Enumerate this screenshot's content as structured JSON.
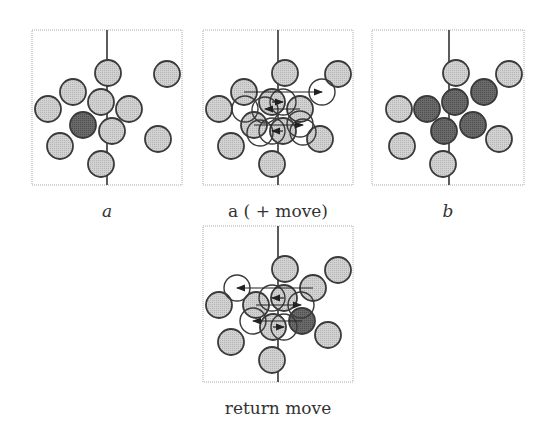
{
  "colors": {
    "light_fill": "#c8c8c8",
    "dark_fill": "#606060",
    "stroke": "#3a3a3a",
    "frame": "#aaaaaa",
    "divider": "#333333",
    "arrow": "#222222"
  },
  "panels": [
    {
      "id": "a",
      "caption": "a",
      "caption_italic": true,
      "frame": {
        "x": 32,
        "y": 30,
        "w": 150,
        "h": 155
      },
      "divider_x": 107,
      "circles": [
        {
          "cx": 108,
          "cy": 73,
          "fill": "light"
        },
        {
          "cx": 167,
          "cy": 74,
          "fill": "light"
        },
        {
          "cx": 73,
          "cy": 92,
          "fill": "light"
        },
        {
          "cx": 48,
          "cy": 109,
          "fill": "light"
        },
        {
          "cx": 101,
          "cy": 102,
          "fill": "light"
        },
        {
          "cx": 129,
          "cy": 109,
          "fill": "light"
        },
        {
          "cx": 83,
          "cy": 125,
          "fill": "dark"
        },
        {
          "cx": 112,
          "cy": 131,
          "fill": "light"
        },
        {
          "cx": 60,
          "cy": 146,
          "fill": "light"
        },
        {
          "cx": 158,
          "cy": 139,
          "fill": "light"
        },
        {
          "cx": 101,
          "cy": 164,
          "fill": "light"
        }
      ],
      "ghosts": [],
      "arrows": []
    },
    {
      "id": "a_move",
      "caption": "a ( + move)",
      "caption_italic": false,
      "frame": {
        "x": 203,
        "y": 30,
        "w": 150,
        "h": 155
      },
      "divider_x": 278,
      "circles": [
        {
          "cx": 285,
          "cy": 73,
          "fill": "light"
        },
        {
          "cx": 338,
          "cy": 74,
          "fill": "light"
        },
        {
          "cx": 244,
          "cy": 92,
          "fill": "light"
        },
        {
          "cx": 219,
          "cy": 109,
          "fill": "light"
        },
        {
          "cx": 272,
          "cy": 102,
          "fill": "light"
        },
        {
          "cx": 300,
          "cy": 109,
          "fill": "light"
        },
        {
          "cx": 254,
          "cy": 125,
          "fill": "light"
        },
        {
          "cx": 283,
          "cy": 131,
          "fill": "light"
        },
        {
          "cx": 231,
          "cy": 146,
          "fill": "light"
        },
        {
          "cx": 320,
          "cy": 139,
          "fill": "light"
        },
        {
          "cx": 272,
          "cy": 164,
          "fill": "light"
        }
      ],
      "ghosts": [
        {
          "cx": 322,
          "cy": 92
        },
        {
          "cx": 283,
          "cy": 102
        },
        {
          "cx": 265,
          "cy": 110
        },
        {
          "cx": 245,
          "cy": 109
        },
        {
          "cx": 300,
          "cy": 124
        },
        {
          "cx": 272,
          "cy": 131
        },
        {
          "cx": 260,
          "cy": 133
        },
        {
          "cx": 303,
          "cy": 132
        }
      ],
      "arrows": [
        {
          "x1": 244,
          "y1": 92,
          "x2": 322,
          "y2": 92
        },
        {
          "x1": 272,
          "y1": 102,
          "x2": 283,
          "y2": 102
        },
        {
          "x1": 300,
          "y1": 109,
          "x2": 265,
          "y2": 109
        },
        {
          "x1": 254,
          "y1": 125,
          "x2": 303,
          "y2": 125
        },
        {
          "x1": 283,
          "y1": 131,
          "x2": 272,
          "y2": 131
        }
      ]
    },
    {
      "id": "b",
      "caption": "b",
      "caption_italic": true,
      "frame": {
        "x": 372,
        "y": 30,
        "w": 152,
        "h": 155
      },
      "divider_x": 449,
      "circles": [
        {
          "cx": 456,
          "cy": 73,
          "fill": "light"
        },
        {
          "cx": 509,
          "cy": 74,
          "fill": "light"
        },
        {
          "cx": 484,
          "cy": 92,
          "fill": "dark"
        },
        {
          "cx": 455,
          "cy": 102,
          "fill": "dark"
        },
        {
          "cx": 427,
          "cy": 109,
          "fill": "dark"
        },
        {
          "cx": 399,
          "cy": 109,
          "fill": "light"
        },
        {
          "cx": 444,
          "cy": 131,
          "fill": "dark"
        },
        {
          "cx": 473,
          "cy": 125,
          "fill": "dark"
        },
        {
          "cx": 402,
          "cy": 146,
          "fill": "light"
        },
        {
          "cx": 499,
          "cy": 139,
          "fill": "light"
        },
        {
          "cx": 443,
          "cy": 164,
          "fill": "light"
        }
      ],
      "ghosts": [],
      "arrows": []
    },
    {
      "id": "return_move",
      "caption": "return move",
      "caption_italic": false,
      "frame": {
        "x": 203,
        "y": 226,
        "w": 150,
        "h": 156
      },
      "divider_x": 278,
      "circles": [
        {
          "cx": 285,
          "cy": 269,
          "fill": "light"
        },
        {
          "cx": 338,
          "cy": 270,
          "fill": "light"
        },
        {
          "cx": 313,
          "cy": 288,
          "fill": "light"
        },
        {
          "cx": 219,
          "cy": 305,
          "fill": "light"
        },
        {
          "cx": 284,
          "cy": 298,
          "fill": "light"
        },
        {
          "cx": 256,
          "cy": 305,
          "fill": "light"
        },
        {
          "cx": 273,
          "cy": 327,
          "fill": "light"
        },
        {
          "cx": 302,
          "cy": 321,
          "fill": "dark"
        },
        {
          "cx": 231,
          "cy": 342,
          "fill": "light"
        },
        {
          "cx": 328,
          "cy": 335,
          "fill": "light"
        },
        {
          "cx": 272,
          "cy": 360,
          "fill": "light"
        }
      ],
      "ghosts": [
        {
          "cx": 237,
          "cy": 288
        },
        {
          "cx": 272,
          "cy": 298
        },
        {
          "cx": 301,
          "cy": 305
        },
        {
          "cx": 284,
          "cy": 327
        },
        {
          "cx": 253,
          "cy": 321
        }
      ],
      "arrows": [
        {
          "x1": 313,
          "y1": 288,
          "x2": 237,
          "y2": 288
        },
        {
          "x1": 284,
          "y1": 298,
          "x2": 272,
          "y2": 298
        },
        {
          "x1": 256,
          "y1": 305,
          "x2": 301,
          "y2": 305
        },
        {
          "x1": 302,
          "y1": 321,
          "x2": 253,
          "y2": 321
        },
        {
          "x1": 273,
          "y1": 327,
          "x2": 284,
          "y2": 327
        }
      ]
    }
  ],
  "captions": [
    {
      "text": "a",
      "x": 27,
      "y": 201,
      "italic": true
    },
    {
      "text": "a ( + move)",
      "x": 198,
      "y": 201,
      "italic": false
    },
    {
      "text": "b",
      "x": 368,
      "y": 201,
      "italic": true
    },
    {
      "text": "return move",
      "x": 198,
      "y": 398,
      "italic": false
    }
  ],
  "radius": 13
}
